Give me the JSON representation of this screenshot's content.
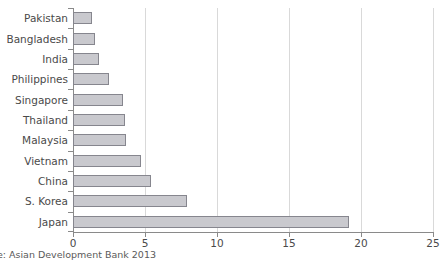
{
  "chart_data": {
    "type": "bar",
    "orientation": "horizontal",
    "title": "",
    "xlabel": "",
    "ylabel": "",
    "categories": [
      "Pakistan",
      "Bangladesh",
      "India",
      "Philippines",
      "Singapore",
      "Thailand",
      "Malaysia",
      "Vietnam",
      "China",
      "S. Korea",
      "Japan"
    ],
    "values": [
      1.3,
      1.5,
      1.8,
      2.5,
      3.5,
      3.6,
      3.7,
      4.7,
      5.4,
      7.9,
      19.2
    ],
    "xlim": [
      0,
      25
    ],
    "xticks": [
      0,
      5,
      10,
      15,
      20,
      25
    ],
    "xtick_labels": [
      "0",
      "5",
      "10",
      "15",
      "20",
      "25"
    ],
    "grid": true,
    "grid_axis": "x",
    "legend": false,
    "bar_fill_color": "#c9c9ce",
    "bar_border_color": "#86868e",
    "gridline_color": "#d9d9d9",
    "axis_color": "#8a8a8a",
    "text_color": "#4a4a4a"
  },
  "source": {
    "note": "rce: Asian Development Bank 2013"
  }
}
